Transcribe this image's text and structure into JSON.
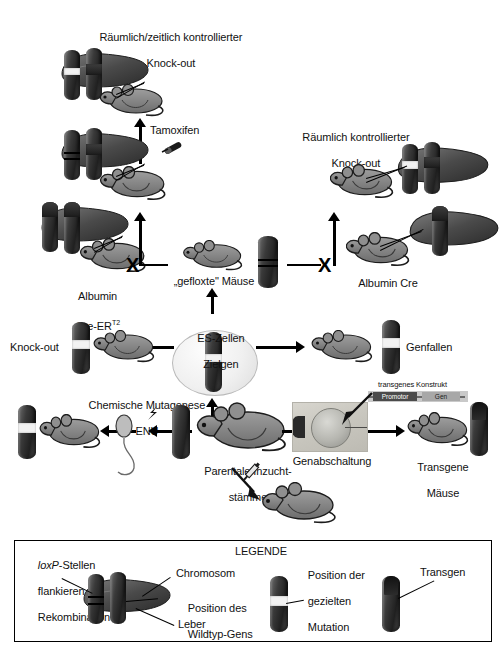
{
  "figure": {
    "language": "de"
  },
  "nodes": {
    "spatiotemporal_ko": {
      "label_line1": "Räumlich/zeitlich kontrollierter",
      "label_line2": "Knock-out"
    },
    "spatial_ko": {
      "label_line1": "Räumlich kontrollierter",
      "label_line2": "Knock-out"
    },
    "tamoxifen": {
      "label": "Tamoxifen"
    },
    "albumin_cre_ert2": {
      "label_line1": "Albumin",
      "label_line2_pre": "Cre-ER",
      "label_line2_sup": "T2"
    },
    "floxed_mice": {
      "label": "„gefloxte\" Mäuse"
    },
    "albumin_cre": {
      "label": "Albumin Cre"
    },
    "es_cells": {
      "label_line1": "ES-Zellen",
      "label_line2": "Zielgen"
    },
    "knock_out": {
      "label": "Knock-out"
    },
    "gene_traps": {
      "label": "Genfallen"
    },
    "chemical_mutagenesis": {
      "label_line1": "Chemische Mutagenese",
      "label_line2": "ENU"
    },
    "parental_strains": {
      "label_line1": "Parentale Inzucht-",
      "label_line2": "stämme"
    },
    "gene_knockdown": {
      "label": "Genabschaltung"
    },
    "transgenic_mice": {
      "label_line1": "Transgene",
      "label_line2": "Mäuse"
    },
    "construct": {
      "title": "transgenes Konstrukt",
      "promotor": "Promotor",
      "gen": "Gen"
    }
  },
  "legend": {
    "title": "LEGENDE",
    "loxp": {
      "line1_italic": "loxP",
      "line1_rest": "-Stellen",
      "line2": "flankieren",
      "line3": "Rekombination"
    },
    "chromosome": "Chromosom",
    "wildtype_position_line1": "Position des",
    "wildtype_position_line2": "Wildtyp-Gens",
    "liver": "Leber",
    "targeted_mutation_line1": "Position der",
    "targeted_mutation_line2": "gezielten",
    "targeted_mutation_line3": "Mutation",
    "transgene": "Transgen"
  },
  "symbols": {
    "cross": "X"
  },
  "colors": {
    "background": "#ffffff",
    "ink": "#000000",
    "chromosome_dark": "#262626",
    "chromosome_mid": "#5a5a5a",
    "band_light": "#f2f2f2",
    "mouse_body": "#8a8a8a",
    "liver_dark": "#3a3a3a",
    "promotor_box": "#4b4b4b",
    "gen_box": "#a8a8a8",
    "legend_border": "#000000"
  }
}
